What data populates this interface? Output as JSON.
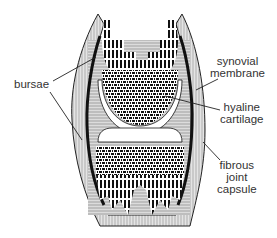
{
  "diagram": {
    "labels": {
      "bursae": "bursae",
      "synovial_membrane_line1": "synovial",
      "synovial_membrane_line2": "membrane",
      "hyaline_cartilage_line1": "hyaline",
      "hyaline_cartilage_line2": "cartilage",
      "fibrous_capsule_line1": "fibrous",
      "fibrous_capsule_line2": "joint",
      "fibrous_capsule_line3": "capsule"
    },
    "colors": {
      "ink": "#111111",
      "label_text": "#333333",
      "tissue_fill": "#d9d9d9",
      "background": "#ffffff"
    }
  }
}
